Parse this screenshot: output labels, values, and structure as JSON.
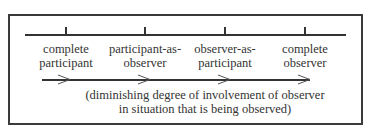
{
  "diagram": {
    "stages": [
      {
        "line1": "complete",
        "line2": "participant"
      },
      {
        "line1": "participant-as-",
        "line2": "observer"
      },
      {
        "line1": "observer-as-",
        "line2": "participant"
      },
      {
        "line1": "complete",
        "line2": "observer"
      }
    ],
    "caption": {
      "line1": "(diminishing degree of involvement of observer",
      "line2": "in situation that is being observed)"
    }
  }
}
